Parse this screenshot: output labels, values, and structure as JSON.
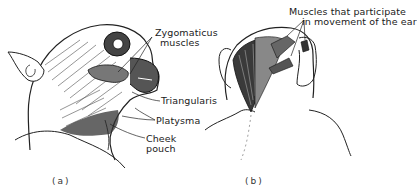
{
  "figure": {
    "panels": [
      {
        "id": "a",
        "caption": "(a)",
        "subject": "monkey head, side view, facial muscles",
        "labels": [
          {
            "text_line1": "Zygomaticus",
            "text_line2": "muscles"
          },
          {
            "text_line1": "Triangularis"
          },
          {
            "text_line1": "Platysma"
          },
          {
            "text_line1": "Cheek",
            "text_line2": "pouch"
          }
        ]
      },
      {
        "id": "b",
        "caption": "(b)",
        "subject": "monkey head, rear view, ear muscles",
        "labels": [
          {
            "text_line1": "Muscles that participate",
            "text_line2": "in movement of the ear"
          }
        ]
      }
    ]
  }
}
